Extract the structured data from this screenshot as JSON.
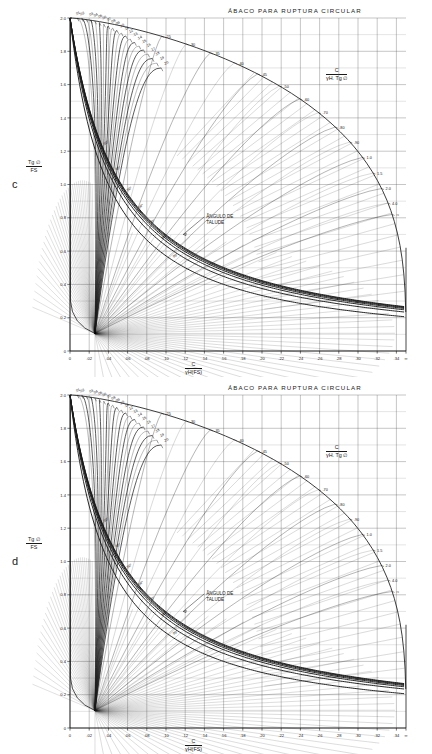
{
  "document": {
    "panels": [
      {
        "letter": "c",
        "title": "ÁBACO PARA RUPTURA CIRCULAR",
        "y_axis_label": {
          "numerator": "Tg ∅",
          "denominator": "FS"
        },
        "x_axis_label": {
          "numerator": "C",
          "denominator": "γH(FS)"
        },
        "right_axis_label": {
          "numerator": "C",
          "denominator": "γH. Tg ∅"
        },
        "annotation": {
          "line1": "ÂNGULO DE",
          "line2": "TALUDE"
        }
      },
      {
        "letter": "d",
        "title": "ÁBACO PARA RUPTURA CIRCULAR",
        "y_axis_label": {
          "numerator": "Tg ∅",
          "denominator": "FS"
        },
        "x_axis_label": {
          "numerator": "C",
          "denominator": "γH(FS)"
        },
        "right_axis_label": {
          "numerator": "C",
          "denominator": "γH. Tg ∅"
        },
        "annotation": {
          "line1": "ÂNGULO DE",
          "line2": "TALUDE"
        }
      }
    ]
  },
  "chart_data": {
    "type": "line",
    "title": "ÁBACO PARA RUPTURA CIRCULAR",
    "count": 2,
    "panel_labels": [
      "c",
      "d"
    ],
    "xlabel": "C / γH(FS)",
    "ylabel": "Tg ∅ / FS",
    "right_axis_label": "C / γH . Tg ∅",
    "xlim": [
      0,
      3.5
    ],
    "ylim": [
      0,
      2.0
    ],
    "grid": true,
    "x_ticks": [
      "0",
      ".02",
      ".04",
      ".06",
      ".08",
      ".10",
      ".12",
      ".14",
      ".16",
      ".18",
      ".20",
      ".22",
      ".24",
      ".26",
      ".28",
      ".30",
      ".32",
      ".34",
      "∞"
    ],
    "x_tick_values": [
      0,
      0.2,
      0.4,
      0.6,
      0.8,
      1.0,
      1.2,
      1.4,
      1.6,
      1.8,
      2.0,
      2.2,
      2.4,
      2.6,
      2.8,
      3.0,
      3.2,
      3.4,
      3.5
    ],
    "y_ticks": [
      "0",
      "0.2",
      "0.4",
      "0.6",
      "0.8",
      "1.0",
      "1.2",
      "1.4",
      "1.6",
      "1.8",
      "2.0"
    ],
    "y_tick_values": [
      0,
      0.2,
      0.4,
      0.6,
      0.8,
      1.0,
      1.2,
      1.4,
      1.6,
      1.8,
      2.0
    ],
    "top_curve_labels": [
      "0",
      ".01",
      ".02",
      ".03",
      ".04",
      ".05",
      ".06",
      ".07",
      ".08",
      ".09",
      ".10",
      ".11",
      ".12",
      ".13",
      ".14",
      ".15",
      ".16",
      ".17",
      ".18",
      ".19",
      ".20"
    ],
    "top_curve_values": [
      0,
      0.01,
      0.02,
      0.03,
      0.04,
      0.05,
      0.06,
      0.07,
      0.08,
      0.09,
      0.1,
      0.11,
      0.12,
      0.13,
      0.14,
      0.15,
      0.16,
      0.17,
      0.18,
      0.19,
      0.2
    ],
    "right_curve_labels": [
      ".25",
      ".30",
      ".35",
      ".40",
      ".45",
      ".50",
      ".60",
      ".70",
      ".80",
      ".90",
      "1.0",
      "1.5",
      "2.0",
      "4.0",
      "∞"
    ],
    "right_curve_values": [
      0.25,
      0.3,
      0.35,
      0.4,
      0.45,
      0.5,
      0.6,
      0.7,
      0.8,
      0.9,
      1.0,
      1.5,
      2.0,
      4.0,
      null
    ],
    "slope_angle_labels": [
      "90°",
      "80°",
      "70°",
      "60°",
      "50°",
      "40°",
      "30°"
    ],
    "slope_angle_values": [
      90,
      80,
      70,
      60,
      50,
      40,
      30
    ],
    "annotation": "ÂNGULO DE TALUDE",
    "series_description": "Family of dimensionless ratio curves C/γH·Tg∅ plotted against C/γH(FS) versus Tg∅/FS, intersected by slope-angle hyperbolae."
  },
  "colors": {
    "ink": "#1a1a1a",
    "grid": "#555555",
    "faint": "#8a8a8a",
    "paper": "#ffffff"
  }
}
